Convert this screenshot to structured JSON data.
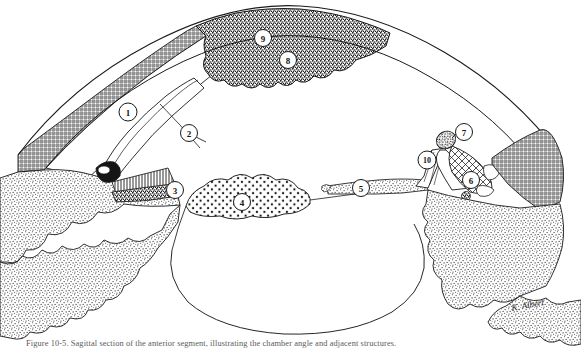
{
  "figure": {
    "artist_signature": "K. Albert",
    "background_color": "#ffffff",
    "ink_color": "#1a1a1a",
    "callouts": [
      {
        "id": "1",
        "label": "1",
        "cx": 128,
        "cy": 112,
        "r": 9,
        "leader": null
      },
      {
        "id": "2",
        "label": "2",
        "cx": 189,
        "cy": 133,
        "r": 8.5,
        "leader": {
          "x2": 205,
          "y2": 140
        }
      },
      {
        "id": "3",
        "label": "3",
        "cx": 175,
        "cy": 190,
        "r": 8.5,
        "leader": null
      },
      {
        "id": "4",
        "label": "4",
        "cx": 242,
        "cy": 202,
        "r": 8.5,
        "leader": null
      },
      {
        "id": "5",
        "label": "5",
        "cx": 361,
        "cy": 188,
        "r": 8.5,
        "leader": null
      },
      {
        "id": "6",
        "label": "6",
        "cx": 471,
        "cy": 180,
        "r": 8.5,
        "leader": null
      },
      {
        "id": "7",
        "label": "7",
        "cx": 464,
        "cy": 132,
        "r": 8.5,
        "leader": {
          "x2": 448,
          "y2": 140
        }
      },
      {
        "id": "8",
        "label": "8",
        "cx": 288,
        "cy": 60,
        "r": 8.5,
        "leader": null
      },
      {
        "id": "9",
        "label": "9",
        "cx": 263,
        "cy": 38,
        "r": 8.5,
        "leader": null
      },
      {
        "id": "10",
        "label": "10",
        "cx": 427,
        "cy": 160,
        "r": 9,
        "leader": {
          "x2": 431,
          "y2": 150
        }
      }
    ],
    "textures": {
      "crosshatch": "fine crossed-line mesh shading",
      "stipple_coarse": "dense random dot stipple",
      "stipple_fine": "open round dot stipple",
      "vertical_lines": "close-set vertical hatch band"
    },
    "caption": {
      "label": "Figure 10-5.",
      "text": "Figure 10-5.  Sagittal section of the anterior segment, illustrating the chamber angle and adjacent structures."
    }
  }
}
